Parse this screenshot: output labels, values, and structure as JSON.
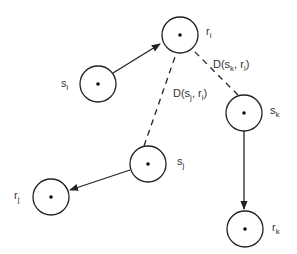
{
  "diagram": {
    "nodes": [
      {
        "id": "s_i",
        "base": "s",
        "sub": "i",
        "cx": 98,
        "cy": 84,
        "label_x": 61,
        "label_y": 84
      },
      {
        "id": "r_i",
        "base": "r",
        "sub": "i",
        "cx": 180,
        "cy": 35,
        "label_x": 207,
        "label_y": 30
      },
      {
        "id": "s_k",
        "base": "s",
        "sub": "k",
        "cx": 244,
        "cy": 113,
        "label_x": 271,
        "label_y": 110
      },
      {
        "id": "s_j",
        "base": "s",
        "sub": "j",
        "cx": 148,
        "cy": 164,
        "label_x": 177,
        "label_y": 162
      },
      {
        "id": "r_j",
        "base": "r",
        "sub": "j",
        "cx": 51,
        "cy": 197,
        "label_x": 14,
        "label_y": 195
      },
      {
        "id": "r_k",
        "base": "r",
        "sub": "k",
        "cx": 245,
        "cy": 229,
        "label_x": 273,
        "label_y": 227
      }
    ],
    "edges": [
      {
        "from": "s_i",
        "to": "r_i",
        "style": "solid-arrow"
      },
      {
        "from": "s_j",
        "to": "r_j",
        "style": "solid-arrow"
      },
      {
        "from": "s_k",
        "to": "r_k",
        "style": "solid-arrow"
      },
      {
        "from": "s_j",
        "to": "r_i",
        "style": "dashed"
      },
      {
        "from": "s_k",
        "to": "r_i",
        "style": "dashed"
      }
    ],
    "distance_labels": {
      "d_sk_ri": {
        "prefix": "D(s",
        "sub1": "k",
        "mid": ", r",
        "sub2": "i",
        "suffix": ")"
      },
      "d_sj_ri": {
        "prefix": "D(s",
        "sub1": "j",
        "mid": ", r",
        "sub2": "i",
        "suffix": ")"
      }
    },
    "colors": {
      "stroke": "#222222",
      "text": "#333333",
      "background": "#ffffff"
    }
  }
}
